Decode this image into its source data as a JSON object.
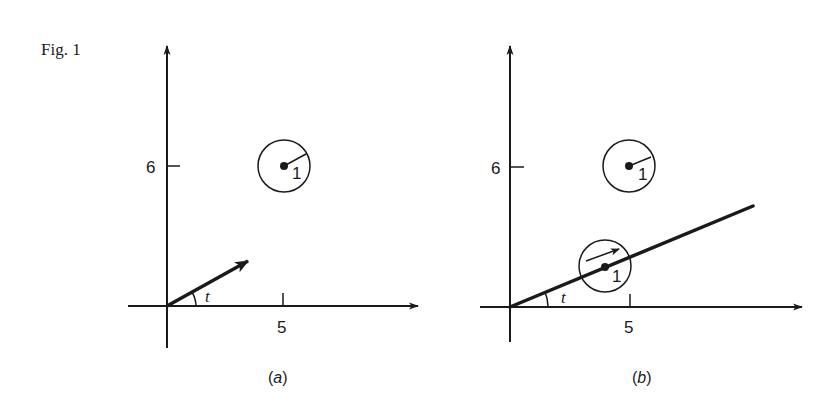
{
  "figure": {
    "label": "Fig. 1",
    "colors": {
      "ink": "#1a1a1a",
      "background": "#ffffff"
    }
  },
  "panel_a": {
    "caption_open": "(",
    "caption_letter": "a",
    "caption_close": ")",
    "y_tick_label": "6",
    "x_tick_label": "5",
    "angle_label": "t",
    "radius_label": "1",
    "description": "Fixed circle of radius 1 centered at (5,6); unit vector from origin at angle t"
  },
  "panel_b": {
    "caption_open": "(",
    "caption_letter": "b",
    "caption_close": ")",
    "y_tick_label": "6",
    "x_tick_label": "5",
    "angle_label": "t",
    "fixed_radius_label": "1",
    "moving_radius_label": "1",
    "description": "Fixed circle at (5,6); circle of radius 1 moving along ray at angle t"
  }
}
